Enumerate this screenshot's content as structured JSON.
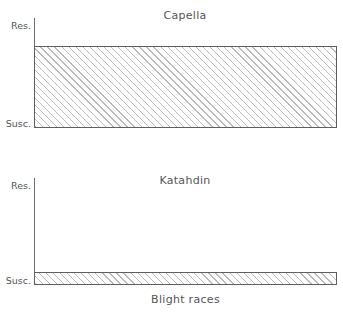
{
  "chart_data": [
    {
      "type": "bar",
      "title": "Capella",
      "xlabel": "",
      "ylabel": "",
      "categories": [
        "Blight races"
      ],
      "values": [
        1.0
      ],
      "ylim": [
        0,
        1
      ],
      "ytick_labels": [
        "Res.",
        "Susc."
      ],
      "ytick_values": [
        1,
        0
      ],
      "grid": false,
      "legend": "none",
      "bar_style": "diagonal-hatch",
      "annotation": "Hatched bar spans nearly the full vertical range, indicating high resistance to all blight races."
    },
    {
      "type": "bar",
      "title": "Katahdin",
      "xlabel": "Blight races",
      "ylabel": "",
      "categories": [
        "Blight races"
      ],
      "values": [
        0.12
      ],
      "ylim": [
        0,
        1
      ],
      "ytick_labels": [
        "Res.",
        "Susc."
      ],
      "ytick_values": [
        1,
        0
      ],
      "grid": false,
      "legend": "none",
      "bar_style": "diagonal-hatch",
      "annotation": "Thin hatched bar near the baseline, indicating susceptibility to all blight races."
    }
  ],
  "panels": [
    {
      "title": "Capella",
      "y_axis": {
        "top_label": "Res.",
        "bottom_label": "Susc."
      }
    },
    {
      "title": "Katahdin",
      "y_axis": {
        "top_label": "Res.",
        "bottom_label": "Susc."
      },
      "x_axis": {
        "label": "Blight races"
      }
    }
  ],
  "colors": {
    "axis": "#6e6e6e",
    "bar_outline": "#5f5f5f",
    "hatch": "#b9b9b9",
    "text": "#555555",
    "background": "#ffffff"
  }
}
